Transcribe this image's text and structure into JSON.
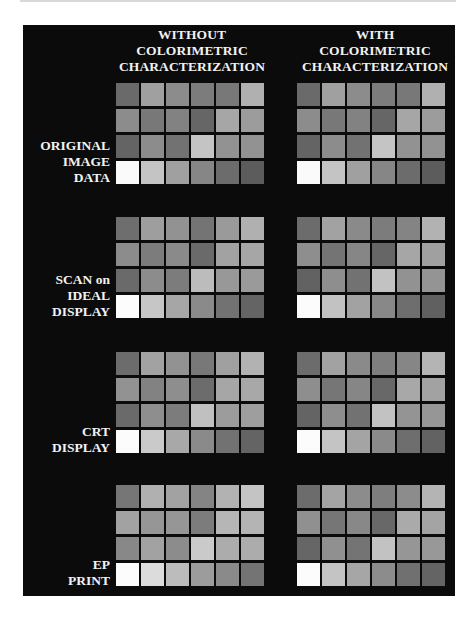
{
  "columns": [
    {
      "lines": [
        "WITHOUT",
        "COLORIMETRIC",
        "CHARACTERIZATION"
      ]
    },
    {
      "lines": [
        "WITH",
        "COLORIMETRIC",
        "CHARACTERIZATION"
      ]
    }
  ],
  "rows": [
    {
      "lines": [
        "ORIGINAL",
        "IMAGE",
        "DATA"
      ]
    },
    {
      "lines": [
        "SCAN on",
        "IDEAL",
        "DISPLAY"
      ]
    },
    {
      "lines": [
        "CRT",
        "DISPLAY"
      ]
    },
    {
      "lines": [
        "EP",
        "PRINT"
      ]
    }
  ],
  "grids": {
    "original_without": [
      [
        "#6a6a6a",
        "#a0a0a0",
        "#8c8c8c",
        "#7c7c7c",
        "#787878",
        "#b0b0b0"
      ],
      [
        "#8c8c8c",
        "#787878",
        "#828282",
        "#666666",
        "#a6a6a6",
        "#9c9c9c"
      ],
      [
        "#646464",
        "#8c8c8c",
        "#727272",
        "#c4c4c4",
        "#929292",
        "#929292"
      ],
      [
        "#fafafa",
        "#c4c4c4",
        "#a0a0a0",
        "#868686",
        "#6c6c6c",
        "#5c5c5c"
      ]
    ],
    "original_with": [
      [
        "#6a6a6a",
        "#a0a0a0",
        "#8c8c8c",
        "#7c7c7c",
        "#787878",
        "#b0b0b0"
      ],
      [
        "#8c8c8c",
        "#787878",
        "#828282",
        "#666666",
        "#a6a6a6",
        "#9c9c9c"
      ],
      [
        "#646464",
        "#8c8c8c",
        "#727272",
        "#c4c4c4",
        "#929292",
        "#929292"
      ],
      [
        "#fafafa",
        "#c4c4c4",
        "#a0a0a0",
        "#868686",
        "#6c6c6c",
        "#5c5c5c"
      ]
    ],
    "scan_without": [
      [
        "#6e6e6e",
        "#9e9e9e",
        "#929292",
        "#747474",
        "#9a9a9a",
        "#b0b0b0"
      ],
      [
        "#8c8c8c",
        "#7c7c7c",
        "#8a8a8a",
        "#6a6a6a",
        "#a2a2a2",
        "#a6a6a6"
      ],
      [
        "#6a6a6a",
        "#8c8c8c",
        "#7c7c7c",
        "#bcbcbc",
        "#989898",
        "#9a9a9a"
      ],
      [
        "#fcfcfc",
        "#c6c6c6",
        "#a6a6a6",
        "#8a8a8a",
        "#727272",
        "#646464"
      ]
    ],
    "scan_with": [
      [
        "#6c6c6c",
        "#a2a2a2",
        "#8a8a8a",
        "#7c7c7c",
        "#848484",
        "#b2b2b2"
      ],
      [
        "#8e8e8e",
        "#747474",
        "#868686",
        "#666666",
        "#a6a6a6",
        "#a0a0a0"
      ],
      [
        "#626262",
        "#8e8e8e",
        "#727272",
        "#c2c2c2",
        "#929292",
        "#949494"
      ],
      [
        "#fcfcfc",
        "#c2c2c2",
        "#a2a2a2",
        "#888888",
        "#6e6e6e",
        "#606060"
      ]
    ],
    "crt_without": [
      [
        "#6c6c6c",
        "#a2a2a2",
        "#929292",
        "#787878",
        "#a0a0a0",
        "#b2b2b2"
      ],
      [
        "#929292",
        "#828282",
        "#8e8e8e",
        "#6c6c6c",
        "#a6a6a6",
        "#a8a8a8"
      ],
      [
        "#6a6a6a",
        "#8e8e8e",
        "#7c7c7c",
        "#c0c0c0",
        "#9c9c9c",
        "#9e9e9e"
      ],
      [
        "#fcfcfc",
        "#cacaca",
        "#a8a8a8",
        "#8a8a8a",
        "#727272",
        "#646464"
      ]
    ],
    "crt_with": [
      [
        "#6c6c6c",
        "#a2a2a2",
        "#8a8a8a",
        "#7e7e7e",
        "#868686",
        "#b4b4b4"
      ],
      [
        "#8e8e8e",
        "#767676",
        "#868686",
        "#686868",
        "#a8a8a8",
        "#a2a2a2"
      ],
      [
        "#646464",
        "#8e8e8e",
        "#727272",
        "#c2c2c2",
        "#949494",
        "#969696"
      ],
      [
        "#fcfcfc",
        "#c4c4c4",
        "#a4a4a4",
        "#8a8a8a",
        "#6e6e6e",
        "#626262"
      ]
    ],
    "ep_without": [
      [
        "#767676",
        "#b0b0b0",
        "#a2a2a2",
        "#848484",
        "#b2b2b2",
        "#c4c4c4"
      ],
      [
        "#a2a2a2",
        "#969696",
        "#969696",
        "#7c7c7c",
        "#b6b6b6",
        "#b4b4b4"
      ],
      [
        "#888888",
        "#a2a2a2",
        "#8c8c8c",
        "#cacaca",
        "#acacac",
        "#acacac"
      ],
      [
        "#fcfcfc",
        "#dcdcdc",
        "#bcbcbc",
        "#9c9c9c",
        "#8a8a8a",
        "#747474"
      ]
    ],
    "ep_with": [
      [
        "#6c6c6c",
        "#a4a4a4",
        "#8c8c8c",
        "#7e7e7e",
        "#8c8c8c",
        "#b4b4b4"
      ],
      [
        "#909090",
        "#767676",
        "#888888",
        "#686868",
        "#aaaaaa",
        "#a4a4a4"
      ],
      [
        "#666666",
        "#909090",
        "#747474",
        "#c2c2c2",
        "#969696",
        "#989898"
      ],
      [
        "#fcfcfc",
        "#c4c4c4",
        "#a6a6a6",
        "#8c8c8c",
        "#707070",
        "#646464"
      ]
    ]
  },
  "colors": {
    "panel_background": "#0b0b0b",
    "label_text": "#f2f2f2",
    "page_background": "#ffffff"
  }
}
